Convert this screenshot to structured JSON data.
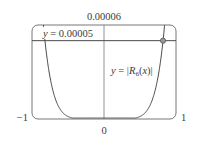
{
  "figure": {
    "type": "graph-window",
    "xrange": [
      -1,
      1
    ],
    "yrange": [
      0,
      6e-05
    ],
    "labels": {
      "ymax": "0.00006",
      "xmin": "−1",
      "xmax": "1",
      "origin": "0",
      "hline": "y = 0.00005",
      "curve_prefix": "y = |R",
      "curve_sub": "6",
      "curve_suffix": "(x)|"
    },
    "hline_value": 5e-05,
    "curve": {
      "name": "|R6(x)|",
      "description": "steep U-shaped curve, near zero for |x| < 0.5, rising to exceed 0.00006 near |x| = 0.85",
      "exponent": 7,
      "intersection_x": 0.82
    },
    "colors": {
      "frame": "#777777",
      "curve": "#4a4a4a",
      "hline": "#4a4a4a",
      "marker": "#6a6a6a"
    }
  }
}
